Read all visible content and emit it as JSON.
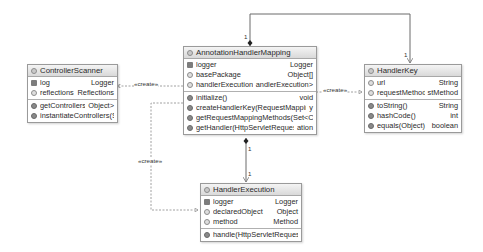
{
  "diagram": {
    "classes": {
      "controller_scanner": {
        "title": "ControllerScanner",
        "fields": [
          {
            "icon": "static-field-icon",
            "name": "log",
            "type": "Logger"
          },
          {
            "icon": "field-icon",
            "name": "reflections",
            "type": "Reflections"
          }
        ],
        "methods": [
          {
            "icon": "method-icon",
            "name": "getControllers()",
            "type": "Object>"
          },
          {
            "icon": "method-icon",
            "name": "instantiateControllers(Se",
            "type": ""
          }
        ]
      },
      "annotation_handler_mapping": {
        "title": "AnnotationHandlerMapping",
        "fields": [
          {
            "icon": "static-field-icon",
            "name": "logger",
            "type": "Logger"
          },
          {
            "icon": "field-icon",
            "name": "basePackage",
            "type": "Object[]"
          },
          {
            "icon": "field-icon",
            "name": "handlerExecutions",
            "type": "andlerExecution>"
          }
        ],
        "methods": [
          {
            "icon": "method-icon",
            "name": "initialize()",
            "type": "void"
          },
          {
            "icon": "method-icon",
            "name": "createHandlerKey(RequestMapping)",
            "type": "y"
          },
          {
            "icon": "method-icon",
            "name": "getRequestMappingMethods(Set<Clas",
            "type": ""
          },
          {
            "icon": "method-icon",
            "name": "getHandler(HttpServletRequest)",
            "type": "ation"
          }
        ]
      },
      "handler_key": {
        "title": "HandlerKey",
        "fields": [
          {
            "icon": "field-icon",
            "name": "url",
            "type": "String"
          },
          {
            "icon": "field-icon",
            "name": "requestMethod",
            "type": "stMethod"
          }
        ],
        "methods": [
          {
            "icon": "method-icon",
            "name": "toString()",
            "type": "String"
          },
          {
            "icon": "method-icon",
            "name": "hashCode()",
            "type": "int"
          },
          {
            "icon": "method-icon",
            "name": "equals(Object)",
            "type": "boolean"
          }
        ]
      },
      "handler_execution": {
        "title": "HandlerExecution",
        "fields": [
          {
            "icon": "static-field-icon",
            "name": "logger",
            "type": "Logger"
          },
          {
            "icon": "field-icon",
            "name": "declaredObject",
            "type": "Object"
          },
          {
            "icon": "field-icon",
            "name": "method",
            "type": "Method"
          }
        ],
        "methods": [
          {
            "icon": "method-icon",
            "name": "handle(HttpServletRequest,",
            "type": ""
          }
        ]
      }
    },
    "relations": [
      {
        "from": "AnnotationHandlerMapping",
        "to": "ControllerScanner",
        "label": "«create»",
        "style": "dashed"
      },
      {
        "from": "AnnotationHandlerMapping",
        "to": "HandlerKey",
        "label": "«create»",
        "style": "dashed"
      },
      {
        "from": "AnnotationHandlerMapping",
        "to": "HandlerExecution",
        "label": "«create»",
        "style": "dashed"
      },
      {
        "from": "AnnotationHandlerMapping",
        "to": "HandlerKey",
        "label_from": "1",
        "label_to": "1",
        "style": "composition"
      },
      {
        "from": "AnnotationHandlerMapping",
        "to": "HandlerExecution",
        "label_from": "1",
        "label_to": "1",
        "style": "composition"
      }
    ],
    "labels": {
      "create": "«create»",
      "one": "1"
    }
  }
}
